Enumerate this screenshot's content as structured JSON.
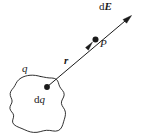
{
  "figure": {
    "background_color": "#ffffff",
    "ink_color": "#1a1a1a",
    "labels": {
      "field_vector": {
        "prefix": "d",
        "symbol": "E"
      },
      "point": "P",
      "distance_vector": "r",
      "total_charge": "q",
      "charge_element": {
        "prefix": "d",
        "symbol": "q"
      }
    },
    "elements": {
      "blob_name": "charge-distribution-blob",
      "source_dot_name": "charge-element-dot",
      "field_point_dot_name": "field-point-dot",
      "vector_line_name": "r-vector-line",
      "arrowhead_tip_name": "field-arrowhead",
      "arrowhead_mid_name": "r-arrowhead"
    },
    "geometry": {
      "line_start": [
        47,
        87
      ],
      "line_end": [
        131,
        16
      ],
      "field_point": [
        95,
        40
      ],
      "mid_arrow": [
        89,
        46
      ]
    }
  }
}
